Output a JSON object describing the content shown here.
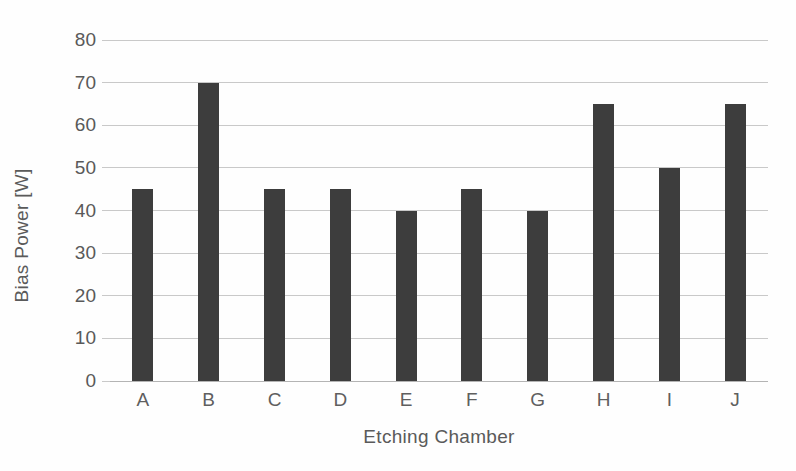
{
  "chart_data": {
    "type": "bar",
    "title": "",
    "xlabel": "Etching Chamber",
    "ylabel": "Bias Power [W]",
    "categories": [
      "A",
      "B",
      "C",
      "D",
      "E",
      "F",
      "G",
      "H",
      "I",
      "J"
    ],
    "values": [
      45,
      70,
      45,
      45,
      40,
      45,
      40,
      65,
      50,
      65
    ],
    "ylim": [
      0,
      80
    ],
    "ytick_labels": [
      "0",
      "10",
      "20",
      "30",
      "40",
      "50",
      "60",
      "70",
      "80"
    ],
    "ytick_values": [
      0,
      10,
      20,
      30,
      40,
      50,
      60,
      70,
      80
    ],
    "ytick_step": 10,
    "grid": true,
    "legend": false,
    "legend_position": "none",
    "bar_color": "#3d3d3d",
    "grid_color": "#c9c9c9",
    "axis_color": "#b4b4b4",
    "text_color": "#595959",
    "background_color": "#fefefe"
  }
}
